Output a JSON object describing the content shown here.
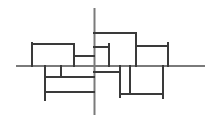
{
  "diagram": {
    "width": 217,
    "height": 121,
    "background": "#ffffff",
    "axis_color": "#7a7a7a",
    "line_color": "#3a3a3a",
    "axis_stroke": 2,
    "line_stroke": 2,
    "axes": [
      {
        "name": "horizontal-axis",
        "x1": 17,
        "y1": 66,
        "x2": 204,
        "y2": 66
      },
      {
        "name": "vertical-axis",
        "x1": 94.5,
        "y1": 9,
        "x2": 94.5,
        "y2": 114
      }
    ],
    "segments": [
      {
        "name": "left-box-left",
        "x1": 32,
        "y1": 43,
        "x2": 32,
        "y2": 66
      },
      {
        "name": "left-box-top",
        "x1": 32,
        "y1": 44,
        "x2": 74,
        "y2": 44
      },
      {
        "name": "left-box-right",
        "x1": 74,
        "y1": 44,
        "x2": 74,
        "y2": 66
      },
      {
        "name": "left-connector",
        "x1": 74,
        "y1": 56,
        "x2": 94,
        "y2": 56
      },
      {
        "name": "top-box-top",
        "x1": 94,
        "y1": 33,
        "x2": 136,
        "y2": 33
      },
      {
        "name": "top-box-right",
        "x1": 136,
        "y1": 33,
        "x2": 136,
        "y2": 66
      },
      {
        "name": "inner-box-top",
        "x1": 94,
        "y1": 47,
        "x2": 109,
        "y2": 47
      },
      {
        "name": "inner-box-right",
        "x1": 109,
        "y1": 44,
        "x2": 109,
        "y2": 66
      },
      {
        "name": "right-box-top",
        "x1": 136,
        "y1": 46,
        "x2": 168,
        "y2": 46
      },
      {
        "name": "right-box-right",
        "x1": 168,
        "y1": 43,
        "x2": 168,
        "y2": 66
      },
      {
        "name": "lower-left-vertical",
        "x1": 45,
        "y1": 66,
        "x2": 45,
        "y2": 100
      },
      {
        "name": "lower-left-short-vertical",
        "x1": 61,
        "y1": 66,
        "x2": 61,
        "y2": 77
      },
      {
        "name": "lower-left-line-1",
        "x1": 45,
        "y1": 77,
        "x2": 94,
        "y2": 77
      },
      {
        "name": "lower-left-line-2",
        "x1": 45,
        "y1": 92,
        "x2": 94,
        "y2": 92
      },
      {
        "name": "lower-right-connector",
        "x1": 94,
        "y1": 72,
        "x2": 120,
        "y2": 72
      },
      {
        "name": "lower-right-vertical-1",
        "x1": 120,
        "y1": 66,
        "x2": 120,
        "y2": 97
      },
      {
        "name": "lower-right-vertical-2",
        "x1": 130,
        "y1": 66,
        "x2": 130,
        "y2": 94
      },
      {
        "name": "lower-right-bottom",
        "x1": 120,
        "y1": 94,
        "x2": 163,
        "y2": 94
      },
      {
        "name": "lower-right-vertical-3",
        "x1": 163,
        "y1": 66,
        "x2": 163,
        "y2": 98
      }
    ]
  }
}
